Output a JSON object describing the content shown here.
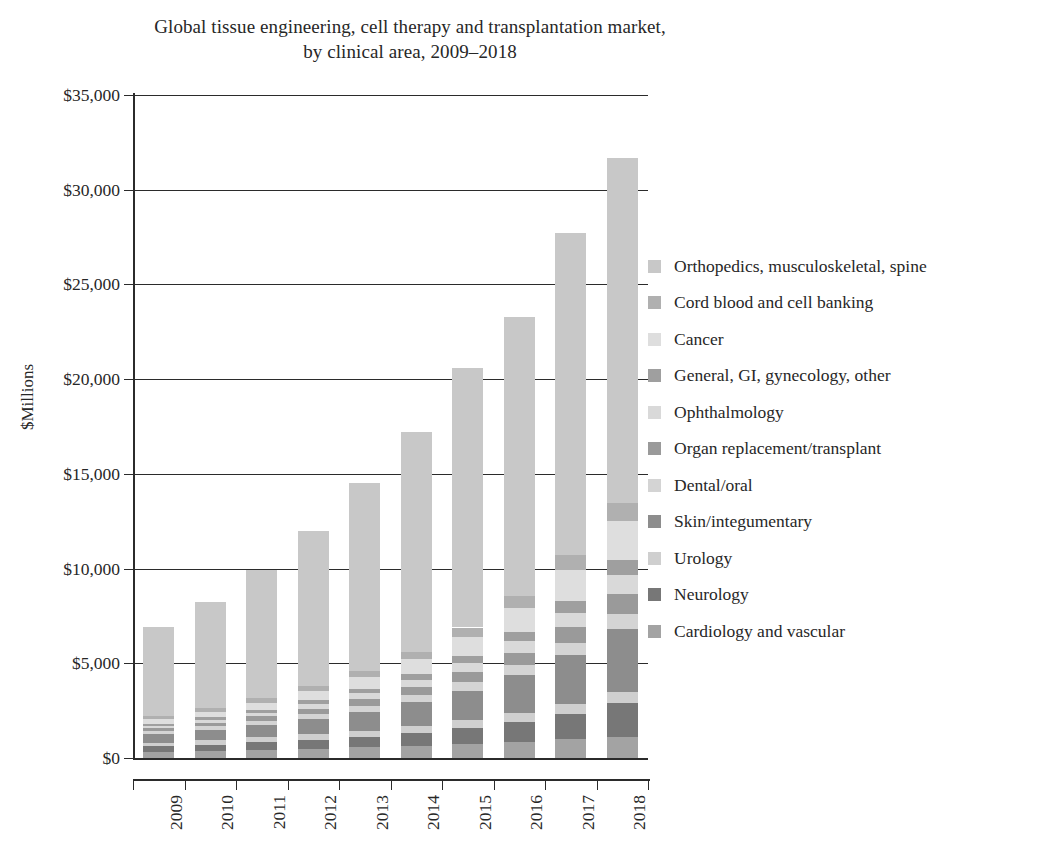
{
  "chart_data": {
    "type": "bar",
    "subtype": "stacked-bar",
    "title": "Global tissue engineering, cell therapy and transplantation market, by clinical area, 2009–2018",
    "title_lines": [
      "Global tissue engineering, cell therapy and transplantation market,",
      "by clinical area, 2009–2018"
    ],
    "xlabel": "",
    "ylabel": "$Millions",
    "categories": [
      "2009",
      "2010",
      "2011",
      "2012",
      "2013",
      "2014",
      "2015",
      "2016",
      "2017",
      "2018"
    ],
    "ylim": [
      0,
      35000
    ],
    "ytick_values": [
      0,
      5000,
      10000,
      15000,
      20000,
      25000,
      30000,
      35000
    ],
    "ytick_labels": [
      "$0",
      "$5,000",
      "$10,000",
      "$15,000",
      "$20,000",
      "$25,000",
      "$30,000",
      "$35,000"
    ],
    "grid": true,
    "grid_axis": "y",
    "legend_position": "right",
    "stack_order_bottom_to_top": [
      "Cardiology and vascular",
      "Neurology",
      "Urology",
      "Skin/integumentary",
      "Dental/oral",
      "Organ replacement/transplant",
      "Ophthalmology",
      "General, GI, gynecology, other",
      "Cancer",
      "Cord blood and cell banking",
      "Orthopedics, musculoskeletal, spine"
    ],
    "series": [
      {
        "name": "Cardiology and vascular",
        "color": "#a3a3a3",
        "values": [
          330,
          380,
          430,
          490,
          560,
          640,
          730,
          850,
          980,
          1120
        ]
      },
      {
        "name": "Neurology",
        "color": "#777777",
        "values": [
          280,
          330,
          400,
          470,
          560,
          690,
          840,
          1050,
          1350,
          1780
        ]
      },
      {
        "name": "Urology",
        "color": "#cfcfcf",
        "values": [
          200,
          230,
          260,
          290,
          330,
          370,
          420,
          470,
          530,
          600
        ]
      },
      {
        "name": "Skin/integumentary",
        "color": "#8d8d8d",
        "values": [
          450,
          540,
          660,
          810,
          1000,
          1250,
          1570,
          2000,
          2570,
          3320
        ]
      },
      {
        "name": "Dental/oral",
        "color": "#d4d4d4",
        "values": [
          170,
          200,
          230,
          270,
          320,
          380,
          450,
          540,
          650,
          790
        ]
      },
      {
        "name": "Organ replacement/transplant",
        "color": "#9a9a9a",
        "values": [
          160,
          190,
          230,
          280,
          340,
          420,
          520,
          650,
          820,
          1040
        ]
      },
      {
        "name": "Ophthalmology",
        "color": "#d9d9d9",
        "values": [
          120,
          150,
          190,
          240,
          300,
          380,
          480,
          610,
          780,
          1000
        ]
      },
      {
        "name": "General, GI, gynecology, other",
        "color": "#9f9f9f",
        "values": [
          110,
          130,
          160,
          200,
          250,
          310,
          390,
          490,
          620,
          780
        ]
      },
      {
        "name": "Cancer",
        "color": "#dedede",
        "values": [
          230,
          290,
          370,
          470,
          600,
          770,
          990,
          1270,
          1630,
          2090
        ]
      },
      {
        "name": "Cord blood and cell banking",
        "color": "#b0b0b0",
        "values": [
          150,
          180,
          220,
          270,
          330,
          410,
          500,
          620,
          770,
          950
        ]
      },
      {
        "name": "Orthopedics, musculoskeletal, spine",
        "color": "#c8c8c8",
        "values": [
          4700,
          5630,
          6750,
          8210,
          9910,
          11580,
          13710,
          14750,
          17000,
          18230
        ]
      }
    ],
    "totals": [
      6900,
      8250,
      9900,
      11700,
      14100,
      16800,
      20100,
      23300,
      27200,
      31700
    ]
  },
  "legend": {
    "items": [
      {
        "label": "Orthopedics, musculoskeletal, spine",
        "color": "#c8c8c8"
      },
      {
        "label": "Cord blood and cell banking",
        "color": "#b0b0b0"
      },
      {
        "label": "Cancer",
        "color": "#dedede"
      },
      {
        "label": "General, GI, gynecology, other",
        "color": "#9f9f9f"
      },
      {
        "label": "Ophthalmology",
        "color": "#d9d9d9"
      },
      {
        "label": "Organ replacement/transplant",
        "color": "#9a9a9a"
      },
      {
        "label": "Dental/oral",
        "color": "#d4d4d4"
      },
      {
        "label": "Skin/integumentary",
        "color": "#8d8d8d"
      },
      {
        "label": "Urology",
        "color": "#cfcfcf"
      },
      {
        "label": "Neurology",
        "color": "#777777"
      },
      {
        "label": "Cardiology and vascular",
        "color": "#a3a3a3"
      }
    ]
  },
  "colors": {
    "axis": "#2b2b2b",
    "text": "#272727",
    "background": "#ffffff"
  }
}
